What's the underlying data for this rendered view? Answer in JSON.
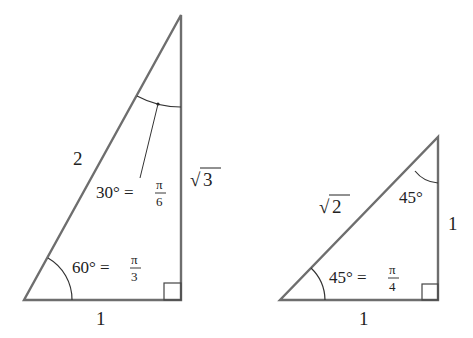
{
  "diagram": {
    "type": "special-right-triangles",
    "colors": {
      "edge": "#6e6e6e",
      "text": "#222222",
      "background": "#ffffff"
    },
    "triangle_30_60_90": {
      "hypotenuse_label": "2",
      "vertical_side_prefix": "√",
      "vertical_side_value": "3",
      "base_label": "1",
      "top_angle": {
        "degrees": "30° =",
        "numerator": "π",
        "denominator": "6"
      },
      "bottom_angle": {
        "degrees": "60° =",
        "numerator": "π",
        "denominator": "3"
      },
      "right_angle_marker": true
    },
    "triangle_45_45_90": {
      "hypotenuse_prefix": "√",
      "hypotenuse_value": "2",
      "vertical_side_label": "1",
      "base_label": "1",
      "top_angle": {
        "degrees": "45°"
      },
      "bottom_angle": {
        "degrees": "45° =",
        "numerator": "π",
        "denominator": "4"
      },
      "right_angle_marker": true
    }
  }
}
